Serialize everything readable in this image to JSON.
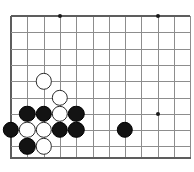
{
  "figure": {
    "kind": "go-board-diagram",
    "width": 194,
    "height": 172,
    "background_color": "#ffffff"
  },
  "board": {
    "line_color": "#8d8d8d",
    "edge_line_color": "#5d5d5d",
    "origin_x": 11,
    "origin_y": 16,
    "spacing": 16.3,
    "columns": 12,
    "rows": 10,
    "left_edge_visible": true,
    "top_edge_visible": true,
    "bottom_edge_visible": true,
    "right_edge_visible": false,
    "bottom_edge_y": 157,
    "star_points": [
      {
        "name": "star-point-upper-left",
        "col": 3,
        "row": 0
      },
      {
        "name": "star-point-upper-right",
        "col": 9,
        "row": 0
      },
      {
        "name": "star-point-lower-right",
        "col": 9,
        "row": 6
      }
    ]
  },
  "stones": {
    "black_color": "#131313",
    "white_color": "#ffffff",
    "radius": 8.2,
    "items": [
      {
        "name": "white-stone-c2r4",
        "color": "white",
        "col": 2,
        "row": 4
      },
      {
        "name": "white-stone-c3r5",
        "color": "white",
        "col": 3,
        "row": 5
      },
      {
        "name": "black-stone-c1r6",
        "color": "black",
        "col": 1,
        "row": 6
      },
      {
        "name": "black-stone-c2r6",
        "color": "black",
        "col": 2,
        "row": 6
      },
      {
        "name": "white-stone-c3r6",
        "color": "white",
        "col": 3,
        "row": 6
      },
      {
        "name": "black-stone-c4r6",
        "color": "black",
        "col": 4,
        "row": 6
      },
      {
        "name": "black-stone-c0r7",
        "color": "black",
        "col": 0,
        "row": 7
      },
      {
        "name": "white-stone-c1r7",
        "color": "white",
        "col": 1,
        "row": 7
      },
      {
        "name": "white-stone-c2r7",
        "color": "white",
        "col": 2,
        "row": 7
      },
      {
        "name": "black-stone-c3r7",
        "color": "black",
        "col": 3,
        "row": 7
      },
      {
        "name": "black-stone-c4r7",
        "color": "black",
        "col": 4,
        "row": 7
      },
      {
        "name": "black-stone-c7r7",
        "color": "black",
        "col": 7,
        "row": 7
      },
      {
        "name": "black-stone-c1r8",
        "color": "black",
        "col": 1,
        "row": 8
      },
      {
        "name": "white-stone-c2r8",
        "color": "white",
        "col": 2,
        "row": 8
      }
    ]
  }
}
